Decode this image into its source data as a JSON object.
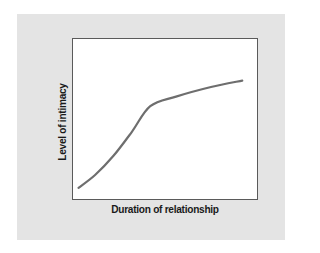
{
  "chart_data": {
    "type": "line",
    "title": "",
    "xlabel": "Duration of relationship",
    "ylabel": "Level of intimacy",
    "xlim": [
      0,
      100
    ],
    "ylim": [
      0,
      100
    ],
    "grid": false,
    "legend": null,
    "x_ticks": [],
    "y_ticks": [],
    "series": [
      {
        "name": "Intimacy over time",
        "color": "#6e6e6e",
        "x": [
          3,
          12,
          22,
          32,
          42,
          56,
          75,
          92
        ],
        "y": [
          7,
          15,
          27,
          42,
          58,
          64,
          70,
          74
        ]
      }
    ]
  },
  "colors": {
    "panel_background": "#e4e4e4",
    "plot_background": "#ffffff",
    "plot_border": "#5a5a5a",
    "line": "#6e6e6e",
    "label_text": "#1a1a1a"
  }
}
